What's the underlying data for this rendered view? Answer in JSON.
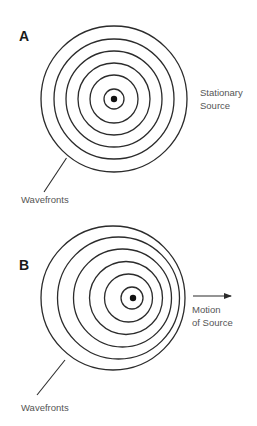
{
  "colors": {
    "background": "#ffffff",
    "ring_stroke": "#2b2b2b",
    "label_text": "#555555",
    "panel_letter": "#1a1a1a",
    "source_dot": "#111111"
  },
  "panels": [
    {
      "id": "A",
      "letter": "A",
      "source_label_lines": [
        "Stationary",
        "Source"
      ],
      "wavefronts_label": "Wavefronts",
      "source": {
        "cx": 114,
        "cy": 99,
        "r": 3.2
      },
      "rings": [
        {
          "cx": 114,
          "cy": 99,
          "r": 10
        },
        {
          "cx": 114,
          "cy": 99,
          "r": 24
        },
        {
          "cx": 114,
          "cy": 99,
          "r": 36
        },
        {
          "cx": 114,
          "cy": 99,
          "r": 48
        },
        {
          "cx": 114,
          "cy": 99,
          "r": 60
        },
        {
          "cx": 114,
          "cy": 99,
          "r": 73
        }
      ],
      "pointer": {
        "x1": 66.5,
        "y1": 158,
        "x2": 44,
        "y2": 192
      }
    },
    {
      "id": "B",
      "letter": "B",
      "motion_label_lines": [
        "Motion",
        "of Source"
      ],
      "wavefronts_label": "Wavefronts",
      "source": {
        "cx": 133,
        "cy": 298,
        "r": 3.2
      },
      "rings": [
        {
          "cx": 132,
          "cy": 298,
          "r": 11
        },
        {
          "cx": 128.5,
          "cy": 298,
          "r": 24
        },
        {
          "cx": 126,
          "cy": 298,
          "r": 36.5
        },
        {
          "cx": 122.5,
          "cy": 298,
          "r": 49
        },
        {
          "cx": 118.5,
          "cy": 298,
          "r": 61
        },
        {
          "cx": 113,
          "cy": 298,
          "r": 72
        }
      ],
      "pointer": {
        "x1": 65,
        "y1": 360,
        "x2": 37,
        "y2": 395
      },
      "arrow": {
        "x1": 193,
        "y1": 296,
        "x2": 231,
        "y2": 296
      }
    }
  ]
}
